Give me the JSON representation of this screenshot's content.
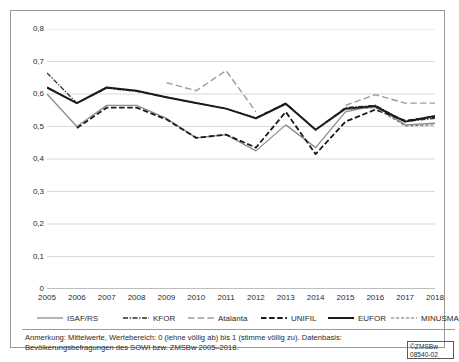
{
  "chart_data": {
    "type": "line",
    "title": "",
    "subtitle": "",
    "xlabel": "",
    "ylabel": "",
    "x": [
      2005,
      2006,
      2007,
      2008,
      2009,
      2010,
      2011,
      2012,
      2013,
      2014,
      2015,
      2016,
      2017,
      2018
    ],
    "categories": [
      "2005",
      "2006",
      "2007",
      "2008",
      "2009",
      "2010",
      "2011",
      "2012",
      "2013",
      "2014",
      "2015",
      "2016",
      "2017",
      "2018"
    ],
    "ylim": [
      0,
      0.8
    ],
    "xlim": [
      2005,
      2018
    ],
    "ytick_labels": [
      "0",
      "0,1",
      "0,2",
      "0,3",
      "0,4",
      "0,5",
      "0,6",
      "0,7",
      "0,8"
    ],
    "ytick_values": [
      0,
      0.1,
      0.2,
      0.3,
      0.4,
      0.5,
      0.6,
      0.7,
      0.8
    ],
    "grid": "horizontal",
    "legend_position": "bottom",
    "series": [
      {
        "name": "ISAF/RS",
        "style": "solid",
        "color": "#8c8c8c",
        "width": 1.3,
        "values": [
          0.6,
          0.5,
          0.565,
          0.565,
          0.525,
          0.465,
          0.475,
          0.425,
          0.505,
          0.435,
          0.545,
          0.565,
          0.505,
          0.51
        ]
      },
      {
        "name": "KFOR",
        "style": "dashdot",
        "color": "#2b2b2b",
        "width": 1.3,
        "values": [
          0.665,
          0.572,
          0.618,
          0.608,
          0.59,
          0.572,
          0.555,
          0.527,
          0.572,
          0.49,
          0.558,
          0.565,
          0.515,
          0.525
        ]
      },
      {
        "name": "Atalanta",
        "style": "dashed-long",
        "color": "#9a9a9a",
        "width": 1.4,
        "values": [
          null,
          null,
          null,
          null,
          0.635,
          0.61,
          0.672,
          0.545,
          null,
          null,
          0.565,
          0.598,
          0.572,
          0.572
        ]
      },
      {
        "name": "UNIFIL",
        "style": "dashed",
        "color": "#1a1a1a",
        "width": 1.8,
        "values": [
          null,
          0.495,
          0.558,
          0.558,
          0.522,
          0.465,
          0.475,
          0.435,
          0.545,
          0.415,
          0.515,
          0.552,
          0.518,
          0.53
        ]
      },
      {
        "name": "EUFOR",
        "style": "solid",
        "color": "#1a1a1a",
        "width": 2.0,
        "values": [
          0.62,
          0.572,
          0.62,
          0.61,
          0.59,
          0.572,
          0.555,
          0.525,
          0.57,
          0.49,
          0.555,
          0.562,
          0.515,
          0.532
        ]
      },
      {
        "name": "MINUSMA",
        "style": "dashed-fine",
        "color": "#6e6e6e",
        "width": 1.1,
        "values": [
          null,
          null,
          null,
          null,
          null,
          null,
          null,
          null,
          null,
          null,
          0.552,
          0.558,
          0.502,
          0.505
        ]
      }
    ]
  },
  "legend": {
    "items": [
      {
        "label": "ISAF/RS"
      },
      {
        "label": "KFOR"
      },
      {
        "label": "Atalanta"
      },
      {
        "label": "UNIFIL"
      },
      {
        "label": "EUFOR"
      },
      {
        "label": "MINUSMA"
      }
    ]
  },
  "note": {
    "text": "Anmerkung: Mittelwerte, Wertebereich: 0 (lehne völlig ab) bis 1 (stimme völlig zu). Datenbasis: Bevölkerungsbefragungen des SOWI bzw. ZMSBw 2005–2018."
  },
  "copyright": {
    "line1": "©ZMSBw",
    "line2": "08540-02"
  }
}
